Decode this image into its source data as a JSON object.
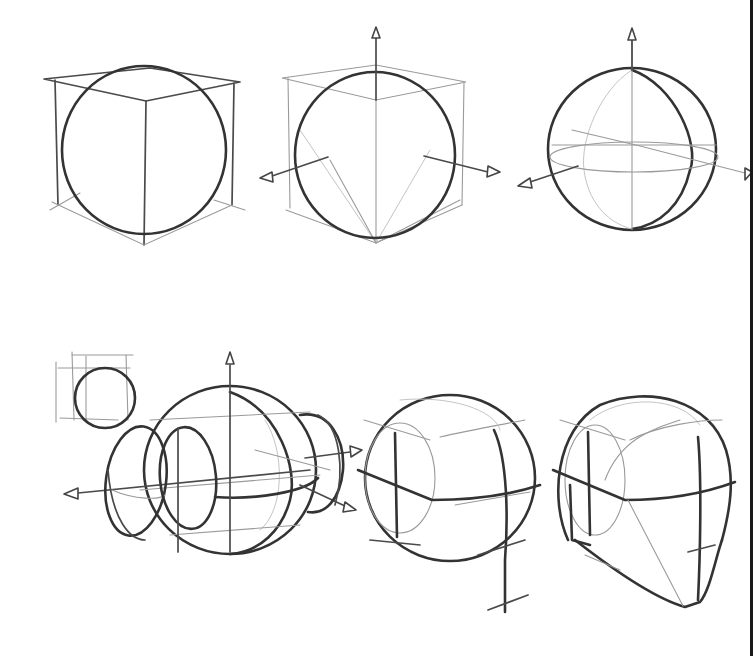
{
  "illustration": {
    "subject": "head construction from sphere (drawing tutorial sketch)",
    "background": "#ffffff",
    "stroke_color": "#333333",
    "figures": [
      {
        "id": "sphere-in-cube",
        "row": 1,
        "position": 1
      },
      {
        "id": "sphere-in-cube-with-axes",
        "row": 1,
        "position": 2
      },
      {
        "id": "sphere-with-axes",
        "row": 1,
        "position": 3
      },
      {
        "id": "sphere-with-side-planes-and-thumbnail",
        "row": 2,
        "position": 1
      },
      {
        "id": "head-cranium-with-centerline",
        "row": 2,
        "position": 2
      },
      {
        "id": "head-with-jaw",
        "row": 2,
        "position": 3
      }
    ]
  }
}
